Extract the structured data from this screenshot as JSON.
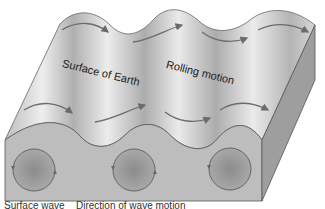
{
  "diagram": {
    "type": "rayleigh-wave-block",
    "labels": {
      "surface": "Surface of Earth",
      "motion": "Rolling motion",
      "bottom_left_cut": "Surface wave",
      "bottom_right_cut": "Direction of wave motion"
    },
    "particle_orbits": 3,
    "surface_arrows": 8,
    "colors": {
      "surface_light": "#e6e6e6",
      "surface_dark": "#a9a9a9",
      "front_face": "#bdbdbd",
      "side_face": "#9e9e9e",
      "orbit_fill": "#8a8a8a",
      "arrow": "#6b6b6b",
      "outline": "#555555"
    }
  }
}
